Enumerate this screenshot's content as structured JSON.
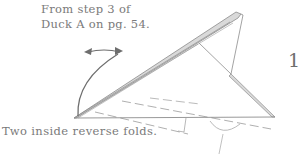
{
  "diagram": {
    "step_number": "1",
    "instruction_top": [
      "From step 3 of",
      "Duck A on pg. 54."
    ],
    "instruction_bottom": "Two inside reverse folds.",
    "colors": {
      "line": "#8c8c8c",
      "fill_band": "#d9d9d9",
      "text": "#7a7a7a",
      "arrow": "#6e6e6e"
    },
    "symbols": [
      "curved-fold-arrow",
      "double-headed-arrow",
      "dashed-valley-fold-line",
      "dashed-valley-fold-line",
      "reverse-fold-arc-symbol",
      "pointer-line"
    ]
  }
}
